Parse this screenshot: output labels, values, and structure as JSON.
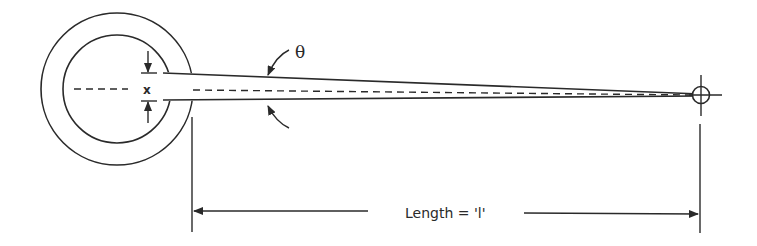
{
  "diagram": {
    "labels": {
      "angle": "θ",
      "gap": "x",
      "length": "Length = 'l'"
    },
    "colors": {
      "stroke": "#2a2a2a",
      "background": "#ffffff"
    }
  }
}
